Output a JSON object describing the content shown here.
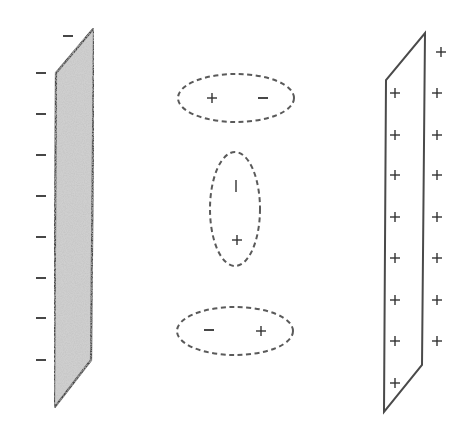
{
  "diagram": {
    "title": "",
    "colors": {
      "line": "#4a4a4a",
      "negative_plate_fill": "#c8c8c8",
      "dashed": "#5a5a5a",
      "charge_text": "#333333"
    },
    "left_plate": {
      "label": "negative plate",
      "charge_symbol": "−",
      "charges": [
        {
          "symbol": "−",
          "x": 68,
          "y": 36
        },
        {
          "symbol": "−",
          "x": 41,
          "y": 73
        },
        {
          "symbol": "−",
          "x": 41,
          "y": 114
        },
        {
          "symbol": "−",
          "x": 41,
          "y": 155
        },
        {
          "symbol": "−",
          "x": 41,
          "y": 196
        },
        {
          "symbol": "−",
          "x": 41,
          "y": 237
        },
        {
          "symbol": "−",
          "x": 41,
          "y": 278
        },
        {
          "symbol": "−",
          "x": 41,
          "y": 318
        },
        {
          "symbol": "−",
          "x": 41,
          "y": 360
        }
      ]
    },
    "dipoles": [
      {
        "orientation": "horizontal",
        "cx": 236,
        "cy": 98,
        "rx": 58,
        "ry": 24,
        "charges": [
          {
            "symbol": "+",
            "x": 212,
            "y": 98
          },
          {
            "symbol": "−",
            "x": 263,
            "y": 98
          }
        ]
      },
      {
        "orientation": "vertical",
        "cx": 235,
        "cy": 209,
        "rx": 25,
        "ry": 57,
        "charges": [
          {
            "symbol": "|",
            "x": 236,
            "y": 186
          },
          {
            "symbol": "+",
            "x": 237,
            "y": 240
          }
        ]
      },
      {
        "orientation": "horizontal",
        "cx": 235,
        "cy": 331,
        "rx": 58,
        "ry": 24,
        "charges": [
          {
            "symbol": "−",
            "x": 209,
            "y": 330
          },
          {
            "symbol": "+",
            "x": 261,
            "y": 331
          }
        ]
      }
    ],
    "right_plate": {
      "label": "positive plate",
      "charge_symbol": "+",
      "inside_charges": [
        {
          "symbol": "+",
          "x": 395,
          "y": 93
        },
        {
          "symbol": "+",
          "x": 395,
          "y": 135
        },
        {
          "symbol": "+",
          "x": 395,
          "y": 175
        },
        {
          "symbol": "+",
          "x": 395,
          "y": 217
        },
        {
          "symbol": "+",
          "x": 395,
          "y": 258
        },
        {
          "symbol": "+",
          "x": 395,
          "y": 300
        },
        {
          "symbol": "+",
          "x": 395,
          "y": 341
        },
        {
          "symbol": "+",
          "x": 395,
          "y": 383
        }
      ],
      "outside_charges": [
        {
          "symbol": "+",
          "x": 441,
          "y": 52
        },
        {
          "symbol": "+",
          "x": 437,
          "y": 93
        },
        {
          "symbol": "+",
          "x": 437,
          "y": 135
        },
        {
          "symbol": "+",
          "x": 437,
          "y": 175
        },
        {
          "symbol": "+",
          "x": 437,
          "y": 217
        },
        {
          "symbol": "+",
          "x": 437,
          "y": 258
        },
        {
          "symbol": "+",
          "x": 437,
          "y": 300
        },
        {
          "symbol": "+",
          "x": 437,
          "y": 341
        }
      ]
    }
  }
}
